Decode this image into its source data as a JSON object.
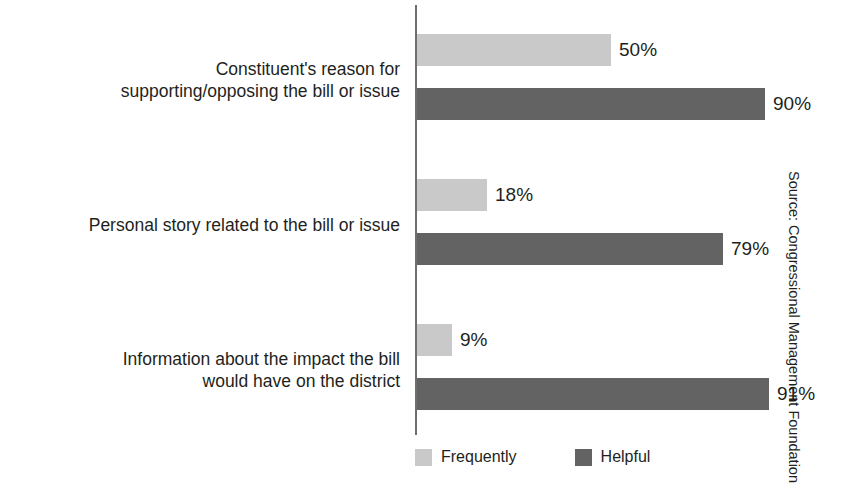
{
  "chart_data": {
    "type": "bar",
    "orientation": "horizontal",
    "title": "",
    "xlabel": "",
    "ylabel": "",
    "xlim": [
      0,
      100
    ],
    "grid": false,
    "legend_position": "bottom",
    "value_suffix": "%",
    "categories": [
      "Constituent's reason for\nsupporting/opposing the bill or issue",
      "Personal story related to the bill or issue",
      "Information about the impact the bill\nwould have on the district"
    ],
    "series": [
      {
        "name": "Frequently",
        "color": "#c9c9c9",
        "values": [
          50,
          18,
          9
        ],
        "value_labels": [
          "50%",
          "18%",
          "9%"
        ]
      },
      {
        "name": "Helpful",
        "color": "#636363",
        "values": [
          90,
          79,
          91
        ],
        "value_labels": [
          "90%",
          "79%",
          "91%"
        ]
      }
    ],
    "source": "Source: Congressional Management Foundation"
  },
  "legend": {
    "items": [
      {
        "label": "Frequently",
        "color": "#c9c9c9"
      },
      {
        "label": "Helpful",
        "color": "#636363"
      }
    ]
  },
  "axis": {
    "line_color": "#6d6e71"
  }
}
